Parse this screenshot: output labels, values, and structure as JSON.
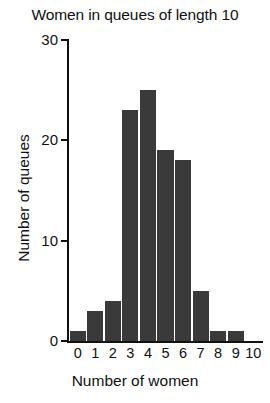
{
  "chart_data": {
    "type": "bar",
    "title": "Women in queues of length 10",
    "xlabel": "Number of women",
    "ylabel": "Number of queues",
    "categories": [
      "0",
      "1",
      "2",
      "3",
      "4",
      "5",
      "6",
      "7",
      "8",
      "9",
      "10"
    ],
    "values": [
      1,
      3,
      4,
      23,
      25,
      19,
      18,
      5,
      1,
      1,
      0
    ],
    "ylim": [
      0,
      30
    ],
    "yticks": [
      "0",
      "10",
      "20",
      "30"
    ],
    "ytick_values": [
      0,
      10,
      20,
      30
    ],
    "grid": false,
    "legend": "none",
    "bar_color": "#3a3a3a",
    "axis_color": "#111111",
    "background_color": "#ffffff"
  }
}
